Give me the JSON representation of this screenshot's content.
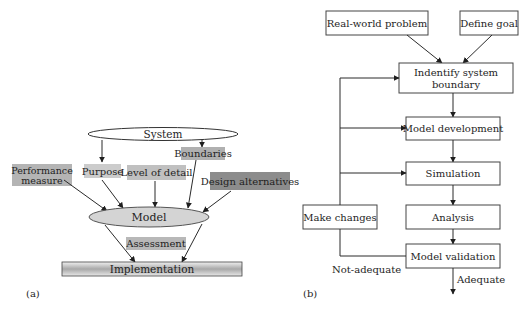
{
  "panel_a": {
    "caption": "(a)",
    "system": "System",
    "boundaries": "Boundaries",
    "purpose": "Purpose",
    "level_of_detail": "Level of detail",
    "performance_measure_line1": "Performance",
    "performance_measure_line2": "measure",
    "design_alternatives": "Design alternatives",
    "model": "Model",
    "assessment": "Assessment",
    "implementation": "Implementation",
    "colors": {
      "light_gray_box": "#c8c8c8",
      "mid_gray_box": "#b0b0b0",
      "dark_gray_box": "#8c8c8c",
      "model_ellipse": "#d4d4d4"
    }
  },
  "panel_b": {
    "caption": "(b)",
    "real_world_problem": "Real-world problem",
    "define_goal": "Define goal",
    "identify_line1": "Indentify system",
    "identify_line2": "boundary",
    "model_development": "Model development",
    "simulation": "Simulation",
    "analysis": "Analysis",
    "make_changes": "Make changes",
    "model_validation": "Model validation",
    "not_adequate": "Not-adequate",
    "adequate": "Adequate"
  }
}
